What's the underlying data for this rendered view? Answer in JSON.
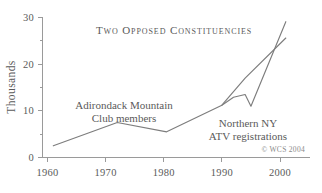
{
  "chart_data": {
    "type": "line",
    "title": "Two Opposed Constituencies",
    "xlabel": "",
    "ylabel": "Thousands",
    "xlim": [
      1958,
      2002
    ],
    "ylim": [
      0,
      30
    ],
    "xticks": [
      1960,
      1970,
      1980,
      1990,
      2000
    ],
    "xtick_labels": [
      "1960",
      "1970",
      "1980",
      "1990",
      "2000"
    ],
    "yticks": [
      0,
      10,
      20,
      30
    ],
    "ytick_labels": [
      "0",
      "10",
      "20",
      "30"
    ],
    "yticks_minor": [
      5,
      15,
      25
    ],
    "grid": false,
    "legend": "inline-annotations",
    "credit": "© WCS 2004",
    "series": [
      {
        "name": "Adirondack Mountain Club members",
        "color": "#7d7d7d",
        "x": [
          1961,
          1972,
          1980.5,
          1990,
          1994,
          2001
        ],
        "values": [
          2.5,
          7.5,
          5.5,
          11.2,
          17.0,
          25.6
        ]
      },
      {
        "name": "Northern NY ATV registrations",
        "color": "#7d7d7d",
        "x": [
          1990,
          1992,
          1994,
          1995,
          2001
        ],
        "values": [
          11.2,
          12.9,
          13.5,
          11.0,
          29.1
        ]
      }
    ],
    "annotations": [
      {
        "name": "amc-label",
        "lines": [
          "Adirondack Mountain",
          "Club members"
        ],
        "x": 1981,
        "y": 12.5
      },
      {
        "name": "atv-label",
        "lines": [
          "Northern NY",
          "ATV registrations"
        ],
        "x": 1995.5,
        "y": 7.5
      }
    ]
  }
}
